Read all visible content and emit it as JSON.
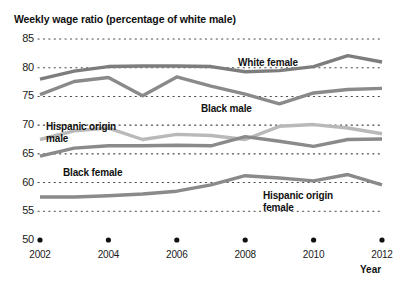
{
  "chart_data": {
    "type": "line",
    "title": "Weekly wage ratio (percentage of white male)",
    "xlabel": "Year",
    "ylabel": "",
    "ylim": [
      50,
      85
    ],
    "xlim": [
      2002,
      2012
    ],
    "yticks": [
      "85",
      "80",
      "75",
      "70",
      "65",
      "60",
      "55",
      "50"
    ],
    "ytick_values": [
      85,
      80,
      75,
      70,
      65,
      60,
      55,
      50
    ],
    "xticks": [
      "2002",
      "2004",
      "2006",
      "2008",
      "2010",
      "2012"
    ],
    "xtick_values": [
      2002,
      2004,
      2006,
      2008,
      2010,
      2012
    ],
    "x": [
      2002,
      2003,
      2004,
      2005,
      2006,
      2007,
      2008,
      2009,
      2010,
      2011,
      2012
    ],
    "grid": "horizontal dotted gridlines at each y tick",
    "legend": "inline series labels placed next to each line",
    "series": [
      {
        "name": "White female",
        "color": "#7d7d7d",
        "label_left": 238,
        "label_top": 57,
        "values": [
          78.0,
          79.4,
          80.2,
          80.3,
          80.3,
          80.2,
          79.3,
          79.5,
          80.2,
          82.1,
          81.0
        ]
      },
      {
        "name": "Black male",
        "color": "#8a8a8a",
        "label_left": 201,
        "label_top": 103,
        "values": [
          75.3,
          77.6,
          78.3,
          75.1,
          78.4,
          76.8,
          75.4,
          73.7,
          75.6,
          76.2,
          76.4
        ]
      },
      {
        "name": "Hispanic origin male",
        "color": "#b9b9b9",
        "label_left": 46,
        "label_top": 121,
        "values": [
          67.5,
          69.0,
          69.5,
          67.5,
          68.4,
          68.2,
          67.5,
          69.8,
          70.1,
          69.5,
          68.5
        ]
      },
      {
        "name": "Black female",
        "color": "#8a8a8a",
        "label_left": 63,
        "label_top": 167,
        "values": [
          64.6,
          66.0,
          66.4,
          66.4,
          66.5,
          66.4,
          68.0,
          67.2,
          66.3,
          67.5,
          67.6
        ]
      },
      {
        "name": "Hispanic origin female",
        "color": "#8a8a8a",
        "label_left": 263,
        "label_top": 190,
        "values": [
          57.5,
          57.5,
          57.7,
          58.0,
          58.5,
          59.6,
          61.2,
          60.8,
          60.3,
          61.4,
          59.6
        ]
      }
    ],
    "gridline_color": "#4a4a4a",
    "marker_color": "#111111",
    "baseline_markers": "solid dots on the 50 baseline at each labeled year"
  }
}
